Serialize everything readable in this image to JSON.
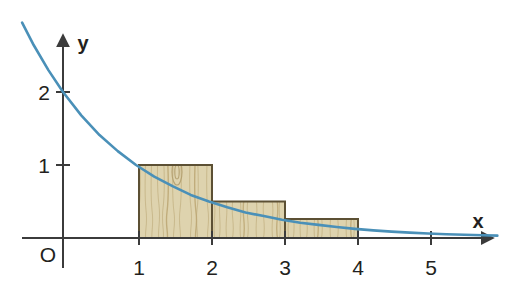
{
  "figure": {
    "background_color": "#ffffff",
    "axis_color": "#3b3b3b",
    "curve_color": "#4a90b8",
    "bar_fill_color": "#ded3ae",
    "bar_grain_color": "#bda875",
    "bar_border_color": "#5c5034",
    "text_color": "#231f20",
    "origin_label": "O",
    "x_axis_label": "x",
    "y_axis_label": "y"
  },
  "axes": {
    "origin_px": {
      "x": 63,
      "y": 238
    },
    "unit_px": 73,
    "x_tick_labels": [
      "1",
      "2",
      "3",
      "4",
      "5"
    ],
    "x_tick_values": [
      1,
      2,
      3,
      4,
      5
    ],
    "y_tick_labels": [
      "1",
      "2"
    ],
    "y_tick_values": [
      1,
      2
    ],
    "x_axis_arrow_tip_px": 497,
    "y_axis_arrow_tip_px": 30
  },
  "chart_data": {
    "type": "area",
    "title": "",
    "subtitle": "",
    "xlabel": "x",
    "ylabel": "y",
    "xlim": [
      -0.6,
      6.0
    ],
    "ylim": [
      0,
      2.6
    ],
    "grid": false,
    "legend": "none",
    "curve": {
      "name": "f(x) = 2 · (1/2)^x",
      "color": "#4a90b8",
      "x": [
        -0.56,
        -0.4,
        -0.2,
        0,
        0.25,
        0.5,
        0.75,
        1,
        1.25,
        1.5,
        1.75,
        2,
        2.25,
        2.5,
        2.75,
        3,
        3.25,
        3.5,
        3.75,
        4,
        4.25,
        4.5,
        4.75,
        5,
        5.25,
        5.5,
        5.75,
        5.95
      ],
      "y": [
        2.95,
        2.64,
        2.3,
        2.0,
        1.68,
        1.41,
        1.19,
        1.0,
        0.84,
        0.71,
        0.59,
        0.5,
        0.42,
        0.35,
        0.3,
        0.25,
        0.21,
        0.18,
        0.15,
        0.125,
        0.105,
        0.088,
        0.074,
        0.0625,
        0.052,
        0.044,
        0.037,
        0.032
      ]
    },
    "bars": {
      "name": "Left-endpoint Riemann rectangles",
      "fill": "#ded3ae",
      "border": "#5c5034",
      "intervals": [
        [
          1,
          2
        ],
        [
          2,
          3
        ],
        [
          3,
          4
        ]
      ],
      "categories": [
        "[1, 2]",
        "[2, 3]",
        "[3, 4]"
      ],
      "values": [
        1.0,
        0.5,
        0.26
      ],
      "widths": [
        1,
        1,
        1
      ]
    },
    "annotations": [
      {
        "text": "O",
        "x": -0.12,
        "y": -0.2
      },
      {
        "text": "x",
        "x": 5.72,
        "y": 0.3
      },
      {
        "text": "y",
        "x": 0.3,
        "y": 2.62
      }
    ]
  }
}
